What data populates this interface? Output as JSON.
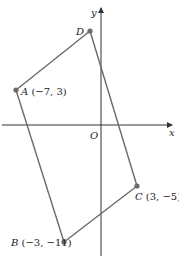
{
  "diagram": {
    "type": "coordinate-plane-quadrilateral",
    "axes": {
      "x_label": "x",
      "y_label": "y",
      "origin_label": "O"
    },
    "points": [
      {
        "name": "A",
        "coords": "(−7, 3)",
        "x": -7,
        "y": 3
      },
      {
        "name": "B",
        "coords": "(−3, −11)",
        "x": -3,
        "y": -11
      },
      {
        "name": "C",
        "coords": "(3, −5)",
        "x": 3,
        "y": -5
      },
      {
        "name": "D",
        "coords": "",
        "x": null,
        "y": null
      }
    ],
    "edges": [
      "AB",
      "BC",
      "CD",
      "DA"
    ],
    "colors": {
      "axis": "#333333",
      "edge": "#6a6a6a",
      "point": "#6a6a6a",
      "text": "#222222"
    }
  }
}
